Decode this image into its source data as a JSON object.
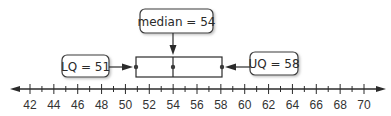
{
  "chart_data": {
    "type": "boxplot",
    "title": "",
    "xlabel": "",
    "ylabel": "",
    "axis": {
      "min": 42,
      "max": 70,
      "labeled_ticks": [
        42,
        44,
        46,
        48,
        50,
        52,
        54,
        56,
        58,
        60,
        62,
        64,
        66,
        68,
        70
      ],
      "minor_tick_step": 1,
      "arrows_both_ends": true
    },
    "box": {
      "lower_quartile": 51,
      "median": 54,
      "upper_quartile": 58
    },
    "annotations": [
      {
        "id": "median",
        "text": "median = 54",
        "points_to": 54,
        "position": "above"
      },
      {
        "id": "lq",
        "text": "LQ = 51",
        "points_to": 51,
        "position": "left"
      },
      {
        "id": "uq",
        "text": "UQ = 58",
        "points_to": 58,
        "position": "right"
      }
    ]
  },
  "labels": {
    "median": "median = 54",
    "lq": "LQ = 51",
    "uq": "UQ = 58"
  },
  "ticks": [
    "42",
    "44",
    "46",
    "48",
    "50",
    "52",
    "54",
    "56",
    "58",
    "60",
    "62",
    "64",
    "66",
    "68",
    "70"
  ],
  "colors": {
    "line": "#2b2b2b",
    "callout_border": "#3a3a3a",
    "callout_shadow": "#c8c8c8",
    "text": "#2a2a2a"
  }
}
